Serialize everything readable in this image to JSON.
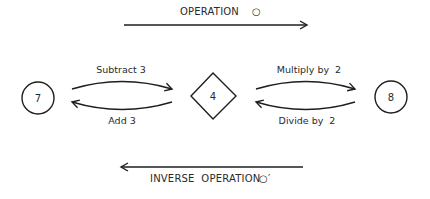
{
  "top_arrow": {
    "label": "OPERATION",
    "symbol": "○",
    "direction": "right"
  },
  "bottom_arrow": {
    "label": "INVERSE  OPERATION",
    "symbol": "○′",
    "direction": "left"
  },
  "nodes": [
    {
      "id": "left",
      "shape": "circle",
      "value": "7"
    },
    {
      "id": "middle",
      "shape": "diamond",
      "value": "4"
    },
    {
      "id": "right",
      "shape": "circle",
      "value": "8"
    }
  ],
  "transitions": [
    {
      "from": "left",
      "to": "middle",
      "label": "Subtract 3"
    },
    {
      "from": "middle",
      "to": "left",
      "label": "Add 3"
    },
    {
      "from": "middle",
      "to": "right",
      "label": "Multiply by  2"
    },
    {
      "from": "right",
      "to": "middle",
      "label": "Divide by  2"
    }
  ]
}
